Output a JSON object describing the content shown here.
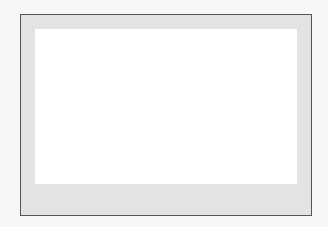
{
  "chart_data": {
    "type": "boxplot",
    "title": "",
    "xlabel": "Annual Average Temperature",
    "ylabel": "",
    "xlim": [
      48.9,
      58.1
    ],
    "ticks": [
      49,
      50,
      51,
      52,
      53,
      54,
      55,
      56,
      57,
      58
    ],
    "tick_labels": [
      "49",
      "50",
      "51",
      "52",
      "53",
      "54",
      "55",
      "56",
      "57",
      "58"
    ],
    "grid": false,
    "box": {
      "whisker_low": 50.2,
      "q1": 52.9,
      "median": 53.9,
      "q3": 55.0,
      "whisker_high": 57.4,
      "outliers": [
        49.1
      ]
    },
    "colors": {
      "box_fill": "#a6a6a6",
      "frame_bg": "#e3e3e3",
      "plot_bg": "#ffffff"
    }
  }
}
